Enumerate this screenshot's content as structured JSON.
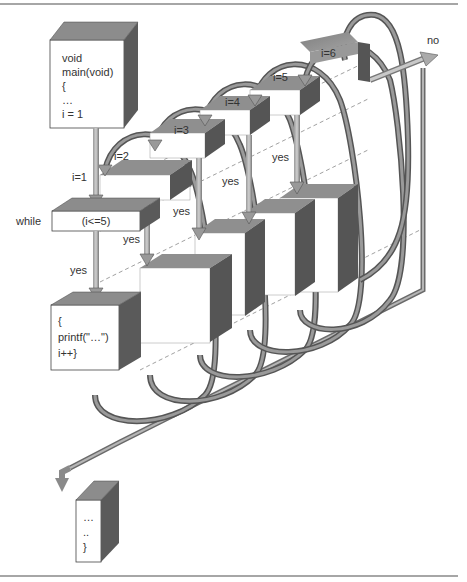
{
  "diagram": {
    "start_block": {
      "lines": [
        "void",
        "main(void)",
        "{",
        "…",
        "i = 1"
      ]
    },
    "condition_block": {
      "keyword": "while",
      "condition": "(i<=5)"
    },
    "body_block": {
      "lines": [
        "{",
        "printf(\"…\")",
        "i++}"
      ]
    },
    "end_block": {
      "lines": [
        "…",
        "..",
        "}"
      ]
    },
    "iteration_labels": [
      "i=1",
      "i=2",
      "i=3",
      "i=4",
      "i=5",
      "i=6"
    ],
    "branch_labels": {
      "yes": "yes",
      "no": "no"
    },
    "colors": {
      "box_face": "#ffffff",
      "box_top": "#8c8c8c",
      "box_side": "#505050",
      "arrow": "#6e6e6e",
      "arrow_light": "#b4b4b4",
      "rule": "#888888"
    }
  }
}
